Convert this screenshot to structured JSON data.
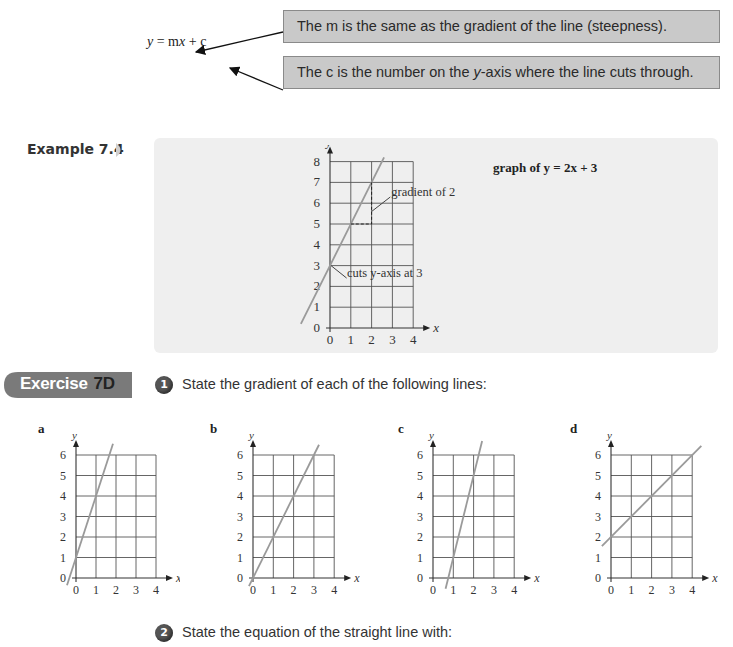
{
  "top": {
    "equation": {
      "y": "y",
      "eq": " = m",
      "x": "x",
      "rest": " + c"
    },
    "callout_m": "The m is the same as the gradient of the line (steepness).",
    "callout_c_pre": "The c is the number on the ",
    "callout_c_y": "y",
    "callout_c_post": "-axis where the line cuts through."
  },
  "example": {
    "label": "Example 7.4",
    "graph_title": "graph of y = 2x + 3",
    "annotation_gradient": "gradient of 2",
    "annotation_intercept": "cuts y-axis at 3"
  },
  "exercise": {
    "tab_word": "Exercise",
    "tab_number": "7D",
    "questions": [
      {
        "number": "1",
        "text": "State the gradient of each of the following lines:"
      },
      {
        "number": "2",
        "text": "State the equation of the straight line with:"
      }
    ],
    "colors": {
      "tab": "#7a7a7a",
      "line": "#9a9a9a",
      "grid": "#555555",
      "panel": "#efefef"
    }
  },
  "chart_data": [
    {
      "id": "example",
      "type": "line",
      "title": "graph of y = 2x + 3",
      "xlabel": "x",
      "ylabel": "y",
      "xlim": [
        0,
        4
      ],
      "ylim": [
        0,
        8
      ],
      "x_ticks": [
        "0",
        "1",
        "2",
        "3",
        "4"
      ],
      "y_ticks": [
        "0",
        "1",
        "2",
        "3",
        "4",
        "5",
        "6",
        "7",
        "8"
      ],
      "grid": true,
      "series": [
        {
          "name": "y = 2x + 3",
          "gradient": 2,
          "intercept": 3,
          "x_range": [
            -1.4,
            2.6
          ]
        }
      ],
      "annotations": [
        {
          "text": "gradient of 2",
          "points": [
            [
              1,
              5
            ],
            [
              2,
              5
            ],
            [
              2,
              7
            ]
          ]
        },
        {
          "text": "cuts y-axis at 3",
          "point": [
            0,
            3
          ]
        }
      ]
    },
    {
      "id": "a",
      "label": "a",
      "type": "line",
      "xlabel": "x",
      "ylabel": "y",
      "xlim": [
        0,
        4
      ],
      "ylim": [
        0,
        6
      ],
      "x_ticks": [
        "0",
        "1",
        "2",
        "3",
        "4"
      ],
      "y_ticks": [
        "0",
        "1",
        "2",
        "3",
        "4",
        "5",
        "6"
      ],
      "grid": true,
      "series": [
        {
          "name": "a",
          "gradient": 3,
          "intercept": 1,
          "x_range": [
            -0.45,
            1.85
          ]
        }
      ]
    },
    {
      "id": "b",
      "label": "b",
      "type": "line",
      "xlabel": "x",
      "ylabel": "y",
      "xlim": [
        0,
        4
      ],
      "ylim": [
        0,
        6
      ],
      "x_ticks": [
        "0",
        "1",
        "2",
        "3",
        "4"
      ],
      "y_ticks": [
        "0",
        "1",
        "2",
        "3",
        "4",
        "5",
        "6"
      ],
      "grid": true,
      "series": [
        {
          "name": "b",
          "gradient": 2,
          "intercept": 0,
          "x_range": [
            -0.2,
            3.25
          ]
        }
      ]
    },
    {
      "id": "c",
      "label": "c",
      "type": "line",
      "xlabel": "x",
      "ylabel": "y",
      "xlim": [
        0,
        4
      ],
      "ylim": [
        0,
        6
      ],
      "x_ticks": [
        "0",
        "1",
        "2",
        "3",
        "4"
      ],
      "y_ticks": [
        "0",
        "1",
        "2",
        "3",
        "4",
        "5",
        "6"
      ],
      "grid": true,
      "series": [
        {
          "name": "c",
          "gradient": 4,
          "intercept": -3,
          "x_range": [
            0.62,
            2.42
          ]
        }
      ]
    },
    {
      "id": "d",
      "label": "d",
      "type": "line",
      "xlabel": "x",
      "ylabel": "y",
      "xlim": [
        0,
        4
      ],
      "ylim": [
        0,
        6
      ],
      "x_ticks": [
        "0",
        "1",
        "2",
        "3",
        "4"
      ],
      "y_ticks": [
        "0",
        "1",
        "2",
        "3",
        "4",
        "5",
        "6"
      ],
      "grid": true,
      "series": [
        {
          "name": "d",
          "gradient": 1,
          "intercept": 2,
          "x_range": [
            -0.45,
            4.45
          ]
        }
      ]
    }
  ]
}
